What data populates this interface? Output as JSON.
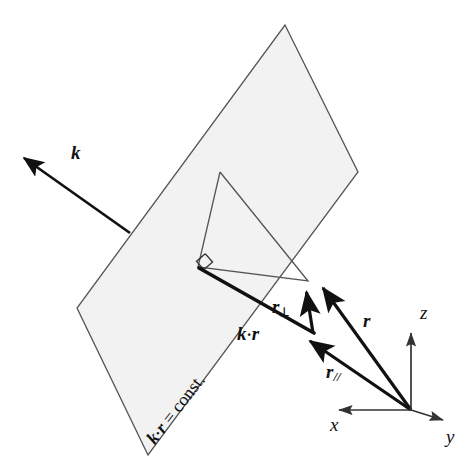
{
  "figure": {
    "background_color": "#ffffff",
    "width": 468,
    "height": 476
  },
  "plane": {
    "name": "constant phase plane",
    "fill_color": "#f2f2f2",
    "stroke_color": "#555555",
    "label": "k·r = const.",
    "label_parts": {
      "vector_k": "k",
      "dot": "·",
      "vector_r": "r",
      "equals_const": "= const."
    },
    "vertices": [
      [
        285,
        25
      ],
      [
        358,
        172
      ],
      [
        148,
        455
      ],
      [
        77,
        308
      ]
    ]
  },
  "inner_triangle": {
    "name": "right triangle in plane",
    "stroke_color": "#555555",
    "vertices": [
      [
        220,
        172
      ],
      [
        198,
        267
      ],
      [
        308,
        281
      ]
    ],
    "right_angle_marker": true
  },
  "vectors": [
    {
      "id": "k",
      "label": "k",
      "label_sub": "",
      "description": "wave vector, normal to the plane",
      "from": [
        130,
        233
      ],
      "to": [
        19,
        155
      ],
      "label_pos": [
        73,
        152
      ],
      "style": "bold-italic",
      "stroke_width": 2.6
    },
    {
      "id": "kr",
      "label": "k",
      "label_mid": "·",
      "label_sub": "r",
      "description": "projection segment k dot r from foot of perpendicular to the tip of r-parallel",
      "from": [
        199,
        268
      ],
      "to": [
        313,
        333
      ],
      "label_pos": [
        240,
        326
      ],
      "style": "bold-italic",
      "stroke_width": 3.4,
      "arrowhead": false
    },
    {
      "id": "r_perp",
      "label": "r",
      "label_sub": "⊥",
      "description": "component of r perpendicular to k (in plane direction)",
      "from": [
        313,
        333
      ],
      "to": [
        305,
        286
      ],
      "label_pos": [
        275,
        301
      ],
      "style": "bold-italic",
      "stroke_width": 3.2
    },
    {
      "id": "r",
      "label": "r",
      "label_sub": "",
      "description": "position vector from the origin",
      "from": [
        411,
        410
      ],
      "to": [
        319,
        282
      ],
      "label_pos": [
        366,
        320
      ],
      "style": "bold-italic",
      "stroke_width": 3.2
    },
    {
      "id": "r_par",
      "label": "r",
      "label_sub": "//",
      "description": "component of r parallel to the plane",
      "from": [
        411,
        410
      ],
      "to": [
        304,
        338
      ],
      "label_pos": [
        330,
        370
      ],
      "style": "bold-italic",
      "stroke_width": 3.2
    }
  ],
  "axes": {
    "origin": [
      411,
      410
    ],
    "color": "#333333",
    "items": [
      {
        "id": "x",
        "label": "x",
        "to": [
          333,
          410
        ],
        "label_pos": [
          331,
          418
        ]
      },
      {
        "id": "y",
        "label": "y",
        "to": [
          449,
          423
        ],
        "label_pos": [
          448,
          431
        ]
      },
      {
        "id": "z",
        "label": "z",
        "to": [
          411,
          327
        ],
        "label_pos": [
          421,
          309
        ]
      }
    ]
  }
}
